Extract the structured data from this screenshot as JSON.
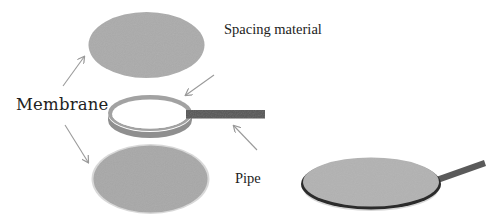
{
  "diagram": {
    "type": "exploded-assembly",
    "labels": {
      "membrane": "Membrane",
      "spacing_material": "Spacing material",
      "pipe": "Pipe"
    },
    "components": [
      {
        "id": "top-membrane",
        "label": "Membrane",
        "shape": "ellipse",
        "color": "#a9a9a9"
      },
      {
        "id": "spacing-ring",
        "label": "Spacing material",
        "shape": "ring",
        "color": "#9a9a9a"
      },
      {
        "id": "pipe",
        "label": "Pipe",
        "shape": "bar",
        "color": "#555555"
      },
      {
        "id": "bottom-membrane",
        "label": "Membrane",
        "shape": "ellipse",
        "color": "#a6a6a6"
      },
      {
        "id": "assembled-module",
        "label": "",
        "shape": "disk-with-handle",
        "color": "#b0b0b0",
        "rim_color": "#2a2a2a"
      }
    ],
    "arrows": [
      {
        "from": "membrane-label",
        "to": "top-membrane"
      },
      {
        "from": "membrane-label",
        "to": "bottom-membrane"
      },
      {
        "from": "spacing-label",
        "to": "spacing-ring"
      },
      {
        "from": "pipe-label",
        "to": "pipe"
      }
    ],
    "colors": {
      "membrane": "#a9a9a9",
      "ring": "#9a9a9a",
      "pipe": "#555555",
      "arrow": "#9a9a9a",
      "text": "#222222"
    }
  }
}
